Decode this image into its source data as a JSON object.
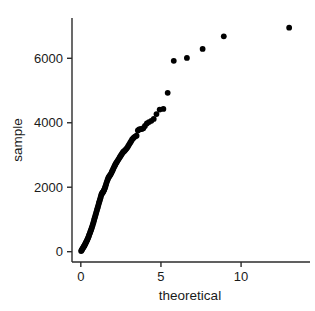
{
  "chart_data": {
    "type": "scatter",
    "title": "",
    "subtitle": "",
    "xlabel": "theoretical",
    "ylabel": "sample",
    "xlim": [
      -0.55,
      14.3
    ],
    "ylim": [
      -320,
      7250
    ],
    "xticks": [
      0,
      5,
      10
    ],
    "xtick_labels": [
      "0",
      "5",
      "10"
    ],
    "yticks": [
      0,
      2000,
      4000,
      6000
    ],
    "ytick_labels": [
      "0",
      "2000",
      "4000",
      "6000"
    ],
    "grid": false,
    "legend": null,
    "marker": {
      "shape": "circle",
      "color": "#000000",
      "size": 4
    },
    "series": [
      {
        "name": "sample vs theoretical",
        "x": [
          0.02,
          0.05,
          0.08,
          0.11,
          0.14,
          0.17,
          0.2,
          0.23,
          0.26,
          0.29,
          0.32,
          0.35,
          0.38,
          0.41,
          0.44,
          0.47,
          0.5,
          0.53,
          0.56,
          0.59,
          0.62,
          0.65,
          0.68,
          0.71,
          0.74,
          0.77,
          0.8,
          0.83,
          0.86,
          0.89,
          0.92,
          0.95,
          0.98,
          1.01,
          1.04,
          1.07,
          1.1,
          1.13,
          1.16,
          1.19,
          1.22,
          1.25,
          1.28,
          1.31,
          1.34,
          1.37,
          1.4,
          1.43,
          1.46,
          1.49,
          1.52,
          1.55,
          1.58,
          1.62,
          1.66,
          1.7,
          1.74,
          1.78,
          1.82,
          1.86,
          1.9,
          1.94,
          1.98,
          2.02,
          2.06,
          2.1,
          2.14,
          2.18,
          2.23,
          2.28,
          2.33,
          2.38,
          2.43,
          2.48,
          2.53,
          2.58,
          2.63,
          2.68,
          2.73,
          2.78,
          2.84,
          2.9,
          2.96,
          3.02,
          3.08,
          3.14,
          3.2,
          3.27,
          3.34,
          3.41,
          3.48,
          3.56,
          3.64,
          3.72,
          3.8,
          3.9,
          4.0,
          4.12,
          4.25,
          4.4,
          4.55,
          4.72,
          4.92,
          5.15,
          5.42,
          5.8,
          6.62,
          7.6,
          8.92,
          13.0
        ],
        "y": [
          20,
          45,
          70,
          95,
          120,
          145,
          170,
          195,
          225,
          255,
          285,
          315,
          345,
          380,
          415,
          450,
          490,
          530,
          570,
          610,
          650,
          690,
          735,
          780,
          830,
          880,
          930,
          985,
          1040,
          1090,
          1140,
          1190,
          1245,
          1300,
          1350,
          1400,
          1455,
          1510,
          1560,
          1610,
          1660,
          1715,
          1770,
          1800,
          1820,
          1840,
          1865,
          1890,
          1920,
          1960,
          2000,
          2050,
          2100,
          2160,
          2220,
          2270,
          2310,
          2340,
          2370,
          2400,
          2440,
          2480,
          2520,
          2565,
          2610,
          2650,
          2690,
          2730,
          2770,
          2810,
          2850,
          2890,
          2930,
          2970,
          3010,
          3050,
          3085,
          3110,
          3130,
          3160,
          3190,
          3230,
          3280,
          3330,
          3380,
          3430,
          3480,
          3520,
          3555,
          3580,
          3600,
          3760,
          3790,
          3800,
          3810,
          3830,
          3900,
          3980,
          4020,
          4060,
          4120,
          4270,
          4410,
          4430,
          4930,
          5920,
          6010,
          6290,
          6680,
          6950
        ]
      }
    ],
    "annotations": []
  },
  "axes": {
    "x_axis_name": "x-axis",
    "y_axis_name": "y-axis"
  }
}
